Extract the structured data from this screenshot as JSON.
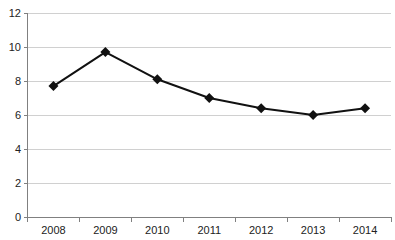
{
  "chart_data": {
    "type": "line",
    "title": "",
    "xlabel": "",
    "ylabel": "",
    "categories": [
      "2008",
      "2009",
      "2010",
      "2011",
      "2012",
      "2013",
      "2014"
    ],
    "series": [
      {
        "name": "series-1",
        "values": [
          7.7,
          9.7,
          8.1,
          7.0,
          6.4,
          6.0,
          6.4
        ]
      }
    ],
    "ylim": [
      0,
      12
    ],
    "yticks": [
      0,
      2,
      4,
      6,
      8,
      10,
      12
    ],
    "grid": true,
    "legend_position": "none",
    "marker": "diamond",
    "colors": {
      "line": "#111111",
      "marker": "#111111",
      "grid": "#d0d0d0",
      "axis": "#808080",
      "tick": "#808080",
      "label": "#222222",
      "background": "#ffffff"
    }
  }
}
